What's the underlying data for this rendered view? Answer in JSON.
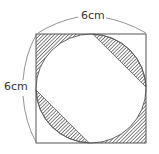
{
  "figure": {
    "type": "geometry-diagram",
    "labels": {
      "top": "6cm",
      "left": "6cm"
    },
    "square": {
      "side": "6cm"
    },
    "shaded_regions": [
      "top-left corner between square and circle",
      "top-right circular segment cut by diagonal chord",
      "bottom-left circular segment cut by diagonal chord",
      "bottom-right corner between square and circle"
    ],
    "colors": {
      "stroke": "#555555",
      "hatch": "#444444",
      "background": "#ffffff"
    }
  }
}
